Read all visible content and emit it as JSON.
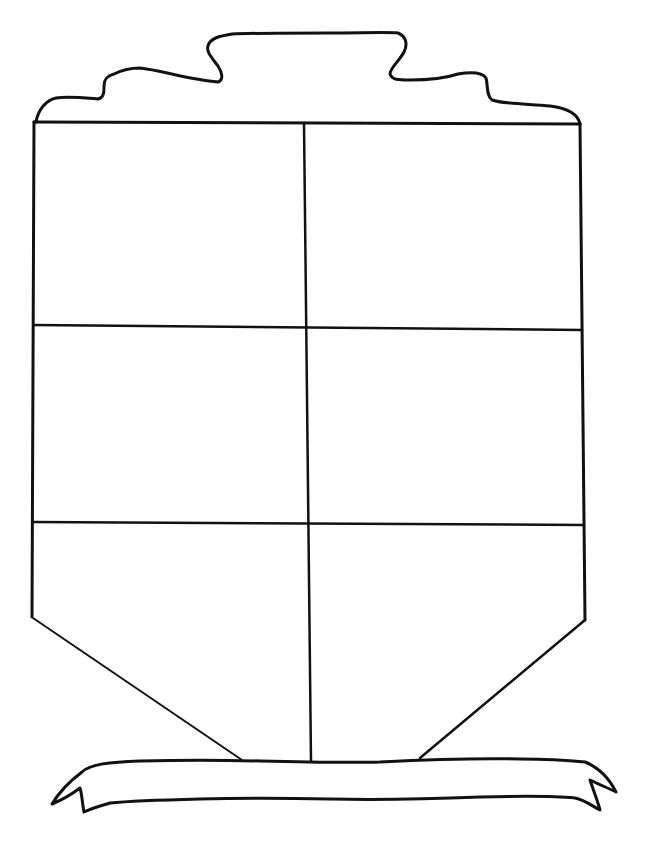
{
  "worksheet": {
    "kind": "coat-of-arms-template",
    "background_color": "#ffffff",
    "line_color": "#111111",
    "shield": {
      "sections": [
        {
          "row": 1,
          "col": 1,
          "label": ""
        },
        {
          "row": 1,
          "col": 2,
          "label": ""
        },
        {
          "row": 2,
          "col": 1,
          "label": ""
        },
        {
          "row": 2,
          "col": 2,
          "label": ""
        },
        {
          "row": 3,
          "col": 1,
          "label": ""
        },
        {
          "row": 3,
          "col": 2,
          "label": ""
        }
      ]
    },
    "banner": {
      "text": ""
    }
  }
}
